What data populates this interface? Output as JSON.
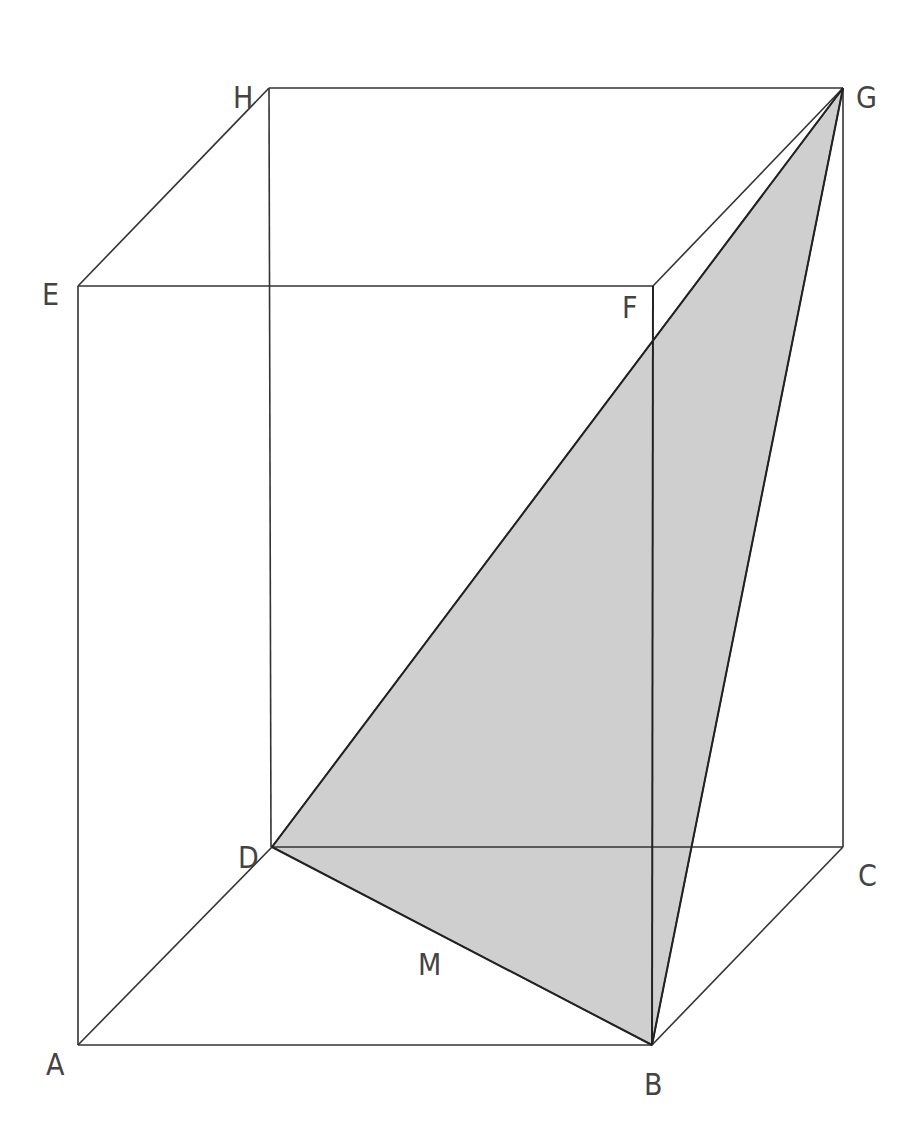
{
  "diagram": {
    "type": "rectangular-prism-with-shaded-triangle",
    "colors": {
      "edge": "#333333",
      "shade": "#cfcfcf",
      "label": "#444444"
    },
    "vertices": {
      "A": {
        "x": 78,
        "y": 1045
      },
      "B": {
        "x": 652,
        "y": 1045
      },
      "C": {
        "x": 843,
        "y": 847
      },
      "D": {
        "x": 272,
        "y": 847
      },
      "E": {
        "x": 78,
        "y": 286
      },
      "F": {
        "x": 653,
        "y": 286
      },
      "G": {
        "x": 843,
        "y": 88
      },
      "H": {
        "x": 269,
        "y": 88
      }
    },
    "shaded_triangle": [
      "D",
      "B",
      "G"
    ],
    "labels": [
      {
        "text": "H",
        "x": 233,
        "y": 108
      },
      {
        "text": "G",
        "x": 856,
        "y": 108
      },
      {
        "text": "E",
        "x": 42,
        "y": 305
      },
      {
        "text": "F",
        "x": 622,
        "y": 318
      },
      {
        "text": "D",
        "x": 238,
        "y": 868
      },
      {
        "text": "C",
        "x": 858,
        "y": 886
      },
      {
        "text": "M",
        "x": 418,
        "y": 975
      },
      {
        "text": "A",
        "x": 46,
        "y": 1075
      },
      {
        "text": "B",
        "x": 644,
        "y": 1095
      }
    ]
  }
}
